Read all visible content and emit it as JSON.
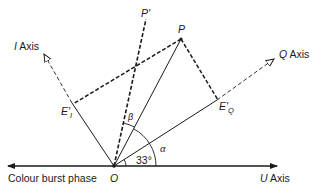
{
  "diagram": {
    "type": "phasor-diagram",
    "labels": {
      "i_axis": "I Axis",
      "i_axis_letter": "I",
      "i_axis_word": " Axis",
      "q_axis": "Q Axis",
      "q_axis_letter": "Q",
      "q_axis_word": " Axis",
      "u_axis": "U Axis",
      "u_axis_letter": "U",
      "u_axis_word": " Axis",
      "colour_burst": "Colour burst phase",
      "origin": "O",
      "point_p": "P",
      "point_p_prime": "P'",
      "e_i_main": "E'",
      "e_i_sub": "I",
      "e_q_main": "E'",
      "e_q_sub": "Q",
      "angle_33": "33°",
      "angle_alpha": "α",
      "angle_beta": "β"
    },
    "angles": {
      "q_axis_deg": 33,
      "i_axis_deg": 123
    },
    "colors": {
      "line": "#1a1a1a",
      "background": "#ffffff"
    }
  }
}
